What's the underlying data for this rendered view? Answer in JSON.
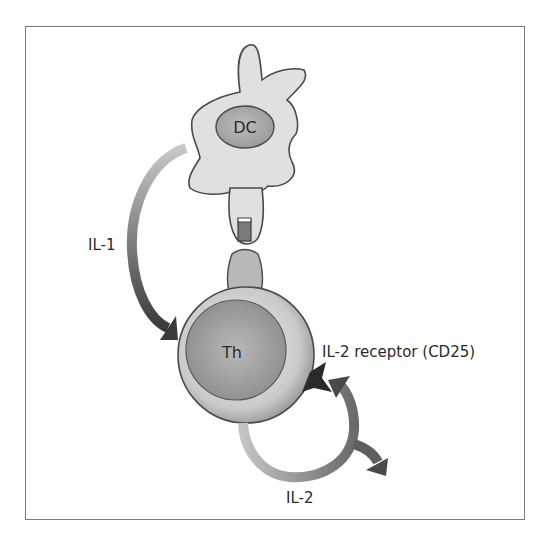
{
  "diagram": {
    "type": "immunology-cell-interaction",
    "nodes": {
      "dendritic_cell": {
        "label": "DC"
      },
      "t_helper_cell": {
        "label": "Th"
      }
    },
    "labels": {
      "il1": "IL-1",
      "il2": "IL-2",
      "il2_receptor": "IL-2 receptor (CD25)"
    },
    "arrows": [
      {
        "from": "DC",
        "to": "Th",
        "label": "IL-1"
      },
      {
        "from": "Th",
        "to": "IL-2 receptor (CD25)",
        "label": "IL-2"
      }
    ],
    "colors": {
      "frame": "#7a7a7a",
      "cell_light": "#d9d9d9",
      "cell_mid": "#a8a8a8",
      "arrow_dark": "#3a3a3a",
      "arrow_light": "#bdbdbd"
    }
  }
}
